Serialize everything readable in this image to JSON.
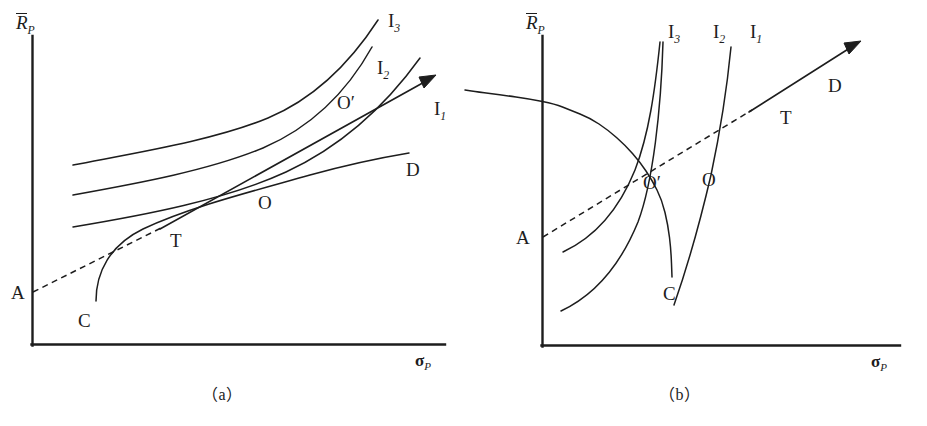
{
  "figure": {
    "domain": "chart-diagram",
    "background_color": "#ffffff",
    "line_color": "#1d1d1d",
    "panels": [
      {
        "id": "a",
        "caption": "（a）",
        "axes": {
          "y_label": "R",
          "y_label_sub": "P",
          "y_label_has_overbar": true,
          "x_label": "σ",
          "x_label_sub": "P"
        },
        "point_labels": [
          "A",
          "C",
          "T",
          "O",
          "O′",
          "D"
        ],
        "curve_labels": [
          {
            "base": "I",
            "sub": "1"
          },
          {
            "base": "I",
            "sub": "2"
          },
          {
            "base": "I",
            "sub": "3"
          }
        ]
      },
      {
        "id": "b",
        "caption": "（b）",
        "axes": {
          "y_label": "R",
          "y_label_sub": "P",
          "y_label_has_overbar": true,
          "x_label": "σ",
          "x_label_sub": "P"
        },
        "point_labels": [
          "A",
          "C",
          "T",
          "O",
          "O′",
          "D"
        ],
        "curve_labels": [
          {
            "base": "I",
            "sub": "1"
          },
          {
            "base": "I",
            "sub": "2"
          },
          {
            "base": "I",
            "sub": "3"
          }
        ]
      }
    ]
  },
  "chart_data": {
    "type": "line",
    "title": "",
    "xlabel": "σ_P",
    "ylabel": "R̄_P",
    "grid": false,
    "legend": "inline-curve-labels",
    "panels": [
      {
        "name": "(a)",
        "description": "Flat indifference curves (low risk aversion): optimum O lies far right on efficient frontier CD; borrowing-lending line A–T–O′ tangent at T.",
        "series": [
          {
            "name": "I1",
            "label": "I₁",
            "kind": "indifference-curve",
            "label_pos": [
              441,
              113
            ],
            "points": [
              [
                73,
                227
              ],
              [
                120,
                213
              ],
              [
                175,
                199
              ],
              [
                230,
                186
              ],
              [
                285,
                169
              ],
              [
                330,
                148
              ],
              [
                370,
                120
              ],
              [
                400,
                85
              ],
              [
                420,
                55
              ]
            ]
          },
          {
            "name": "I2",
            "label": "I₂",
            "kind": "indifference-curve",
            "label_pos": [
              386,
              71
            ],
            "points": [
              [
                73,
                195
              ],
              [
                120,
                182
              ],
              [
                175,
                168
              ],
              [
                230,
                154
              ],
              [
                280,
                137
              ],
              [
                320,
                115
              ],
              [
                352,
                88
              ],
              [
                375,
                58
              ],
              [
                390,
                35
              ]
            ]
          },
          {
            "name": "I3",
            "label": "I₃",
            "kind": "indifference-curve",
            "label_pos": [
              397,
              21
            ],
            "points": [
              [
                73,
                165
              ],
              [
                125,
                152
              ],
              [
                180,
                140
              ],
              [
                235,
                126
              ],
              [
                280,
                110
              ],
              [
                315,
                88
              ],
              [
                345,
                62
              ],
              [
                365,
                38
              ],
              [
                378,
                20
              ]
            ]
          },
          {
            "name": "CD",
            "label": "efficient-frontier-CD",
            "kind": "efficient-frontier",
            "endpoint_labels": {
              "C": [
                84,
                322
              ],
              "D": [
                412,
                170
              ]
            },
            "points": [
              [
                96,
                300
              ],
              [
                98,
                280
              ],
              [
                104,
                262
              ],
              [
                115,
                247
              ],
              [
                133,
                233
              ],
              [
                160,
                222
              ],
              [
                200,
                210
              ],
              [
                250,
                196
              ],
              [
                300,
                180
              ],
              [
                350,
                166
              ],
              [
                395,
                156
              ],
              [
                408,
                153
              ]
            ]
          },
          {
            "name": "AT-line",
            "label": "capital-allocation-line",
            "kind": "tangent-ray",
            "anchor_A": [
              33,
              292
            ],
            "tangency_T": [
              160,
              228
            ],
            "optimum_Oprime": [
              332,
              105
            ],
            "arrow_tip": [
              432,
              78
            ],
            "dashed_segment": [
              [
                33,
                292
              ],
              [
                160,
                228
              ]
            ],
            "solid_segment": [
              [
                160,
                228
              ],
              [
                432,
                78
              ]
            ]
          }
        ],
        "markers": [
          {
            "label": "A",
            "pos": [
              18,
              293
            ],
            "on": "y-axis-intercept"
          },
          {
            "label": "C",
            "pos": [
              84,
              322
            ],
            "on": "frontier-lower-end"
          },
          {
            "label": "T",
            "pos": [
              175,
              241
            ],
            "on": "tangency-point"
          },
          {
            "label": "O",
            "pos": [
              264,
              204
            ],
            "on": "frontier-optimum"
          },
          {
            "label": "O′",
            "pos": [
              345,
              105
            ],
            "on": "line-optimum"
          },
          {
            "label": "D",
            "pos": [
              412,
              170
            ],
            "on": "frontier-upper-end"
          }
        ],
        "axis_origin": [
          32,
          345
        ],
        "axis_x_end": [
          445,
          345
        ],
        "axis_y_top": [
          32,
          36
        ]
      },
      {
        "name": "(b)",
        "description": "Steep indifference curves (high risk aversion): optimum O lies left on efficient frontier CD; borrowing-lending line A–O′–T tangent at T.",
        "series": [
          {
            "name": "I1",
            "label": "I₁",
            "kind": "indifference-curve",
            "label_pos": [
              755,
              33
            ],
            "points": [
              [
                675,
                303
              ],
              [
                686,
                272
              ],
              [
                697,
                240
              ],
              [
                708,
                210
              ],
              [
                718,
                180
              ],
              [
                727,
                145
              ],
              [
                735,
                105
              ],
              [
                742,
                62
              ],
              [
                745,
                48
              ]
            ]
          },
          {
            "name": "I2",
            "label": "I₂",
            "kind": "indifference-curve",
            "label_pos": [
              718,
              33
            ],
            "points": [
              [
                560,
                310
              ],
              [
                582,
                290
              ],
              [
                602,
                265
              ],
              [
                620,
                235
              ],
              [
                637,
                200
              ],
              [
                652,
                160
              ],
              [
                663,
                120
              ],
              [
                671,
                75
              ],
              [
                675,
                50
              ]
            ]
          },
          {
            "name": "I3",
            "label": "I₃",
            "kind": "indifference-curve",
            "label_pos": [
              677,
              33
            ],
            "points": [
              [
                563,
                250
              ],
              [
                585,
                232
              ],
              [
                603,
                210
              ],
              [
                620,
                180
              ],
              [
                634,
                145
              ],
              [
                645,
                110
              ],
              [
                653,
                75
              ],
              [
                658,
                50
              ],
              [
                660,
                42
              ]
            ]
          },
          {
            "name": "CD",
            "label": "efficient-frontier-CD",
            "kind": "efficient-frontier",
            "endpoint_labels": {
              "C": [
                667,
                293
              ],
              "D": [
                830,
                86
              ]
            },
            "points": [
              [
                672,
                277
              ],
              [
                671,
                250
              ],
              [
                668,
                225
              ],
              [
                662,
                200
              ],
              [
                652,
                180
              ],
              [
                640,
                162
              ],
              [
                625,
                145
              ],
              [
                608,
                130
              ],
              [
                590,
                118
              ],
              [
                570,
                110
              ],
              [
                555,
                104
              ],
              [
                530,
                99
              ],
              [
                502,
                95
              ],
              [
                478,
                92
              ],
              [
                465,
                90
              ]
            ]
          },
          {
            "name": "AT-line",
            "label": "capital-allocation-line",
            "kind": "tangent-ray",
            "anchor_A": [
              542,
              237
            ],
            "optimum_Oprime": [
              628,
              186
            ],
            "tangency_T": [
              751,
              110
            ],
            "arrow_tip": [
              857,
              43
            ],
            "dashed_segment": [
              [
                542,
                237
              ],
              [
                751,
                110
              ]
            ],
            "solid_segment": [
              [
                751,
                110
              ],
              [
                857,
                43
              ]
            ]
          }
        ],
        "markers": [
          {
            "label": "A",
            "pos": [
              523,
              237
            ],
            "on": "y-axis-intercept"
          },
          {
            "label": "C",
            "pos": [
              667,
              293
            ],
            "on": "frontier-lower-end"
          },
          {
            "label": "O′",
            "pos": [
              648,
              183
            ],
            "on": "line-optimum"
          },
          {
            "label": "O",
            "pos": [
              705,
              180
            ],
            "on": "frontier-optimum"
          },
          {
            "label": "T",
            "pos": [
              782,
              118
            ],
            "on": "tangency-point"
          },
          {
            "label": "D",
            "pos": [
              830,
              86
            ],
            "on": "frontier-upper-end"
          }
        ],
        "axis_origin": [
          542,
          346
        ],
        "axis_x_end": [
          900,
          346
        ],
        "axis_y_top": [
          542,
          36
        ]
      }
    ]
  },
  "labels": {
    "panel_a": {
      "y_axis_base": "R",
      "y_axis_sub": "P",
      "x_axis_base": "σ",
      "x_axis_sub": "P",
      "A": "A",
      "C": "C",
      "T": "T",
      "O": "O",
      "O_prime": "O′",
      "D": "D",
      "I1_base": "I",
      "I1_sub": "1",
      "I2_base": "I",
      "I2_sub": "2",
      "I3_base": "I",
      "I3_sub": "3",
      "caption": "（a）"
    },
    "panel_b": {
      "y_axis_base": "R",
      "y_axis_sub": "P",
      "x_axis_base": "σ",
      "x_axis_sub": "P",
      "A": "A",
      "C": "C",
      "T": "T",
      "O": "O",
      "O_prime": "O′",
      "D": "D",
      "I1_base": "I",
      "I1_sub": "1",
      "I2_base": "I",
      "I2_sub": "2",
      "I3_base": "I",
      "I3_sub": "3",
      "caption": "（b）"
    }
  }
}
